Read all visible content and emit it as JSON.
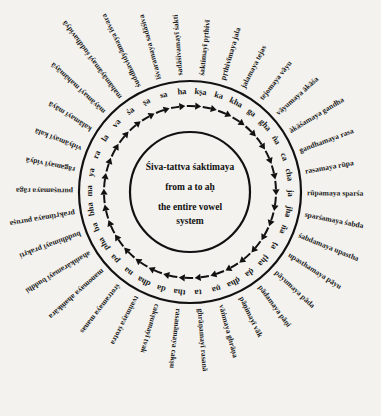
{
  "center": {
    "lines": [
      "Śiva-tattva śaktimaya",
      "from a to aḥ",
      "the entire vowel",
      "system"
    ]
  },
  "geometry": {
    "cx": 190,
    "cy": 192,
    "inner_radius": 60,
    "arrow_radius": 86,
    "letter_radius": 100,
    "outer_radius": 111,
    "spoke_radius": 117,
    "start_angle_deg": 6,
    "step_deg": 10.588
  },
  "colors": {
    "background": "#f3f2ee",
    "ink": "#111111"
  },
  "ring": [
    {
      "letter": "kṣa",
      "label": "śaktimayī pṛthivī"
    },
    {
      "letter": "ka",
      "label": "pṛthivīmaya jala"
    },
    {
      "letter": "kha",
      "label": "jalamaya tejas"
    },
    {
      "letter": "ga",
      "label": "tejomaya vāyu"
    },
    {
      "letter": "gha",
      "label": "vāyumaya ākāśa"
    },
    {
      "letter": "ṅa",
      "label": "ākāśamaya gandha"
    },
    {
      "letter": "ca",
      "label": "gandhamaya rasa"
    },
    {
      "letter": "cha",
      "label": "rasamaya rūpa"
    },
    {
      "letter": "ja",
      "label": "rūpamaya sparśa"
    },
    {
      "letter": "jha",
      "label": "sparśamaya śabda"
    },
    {
      "letter": "ña",
      "label": "śabdamaya upastha"
    },
    {
      "letter": "ṭa",
      "label": "upasthamaya pāyu"
    },
    {
      "letter": "ṭha",
      "label": "pāyumaya pāda"
    },
    {
      "letter": "ḍa",
      "label": "pādamaya pāṇi"
    },
    {
      "letter": "ḍha",
      "label": "pāṇimayī vāk"
    },
    {
      "letter": "ṇa",
      "label": "vāṅmaya ghrāṇa"
    },
    {
      "letter": "ta",
      "label": "ghrāṇamayī rasanā"
    },
    {
      "letter": "tha",
      "label": "rasanāmaya cakṣu"
    },
    {
      "letter": "da",
      "label": "cakṣumayī tvak"
    },
    {
      "letter": "dha",
      "label": "tvaṅmaya śrotra"
    },
    {
      "letter": "na",
      "label": "śrotramaya manas"
    },
    {
      "letter": "pa",
      "label": "manomaya ahaṁkāra"
    },
    {
      "letter": "pha",
      "label": "ahaṁkāramayī buddhi"
    },
    {
      "letter": "ba",
      "label": "buddhimayī prakṛti"
    },
    {
      "letter": "bha",
      "label": "prakṛtimaya puruṣa"
    },
    {
      "letter": "ma",
      "label": "puruṣamaya rāga"
    },
    {
      "letter": "ya",
      "label": "rāgamayī vidyā"
    },
    {
      "letter": "ra",
      "label": "vidyāmayī kalā"
    },
    {
      "letter": "la",
      "label": "kalāmayī māyā"
    },
    {
      "letter": "va",
      "label": "māyāmayī mahāmāyā"
    },
    {
      "letter": "śa",
      "label": "mahāmāyāmayī śuddhavidyā"
    },
    {
      "letter": "ṣa",
      "label": "śuddhavidyāmaya īśvara"
    },
    {
      "letter": "sa",
      "label": "īśvaramaya sadāśiva"
    },
    {
      "letter": "ha",
      "label": "sadāśivamayī śakti"
    }
  ]
}
